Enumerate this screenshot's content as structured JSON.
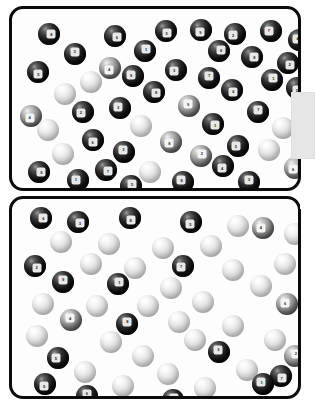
{
  "figure": {
    "panel_count": 2,
    "background_color": "#fefefe",
    "frame_color": "#0b0b0b",
    "frame_radius_px": 14
  },
  "side_tab": {
    "name": "right-edge-tab",
    "color": "#e6e6e6",
    "x": 291,
    "y": 92,
    "width": 24,
    "height": 67
  },
  "side_notch": {
    "name": "right-edge-notch",
    "color": "#ffffff",
    "x": 300,
    "y": 205,
    "width": 15,
    "height": 4
  },
  "chart_data": {
    "type": "scatter",
    "subtitle": "",
    "xlabel": "",
    "ylabel": "",
    "grid": false,
    "legend": "none",
    "xlim": [
      0,
      292
    ],
    "ylim": [
      0,
      203
    ],
    "categories": [
      "dark",
      "mid",
      "light"
    ],
    "series": [
      {
        "name": "panel-top",
        "panel": 1,
        "count": 48,
        "points": [
          {
            "x": 26,
            "y": 14,
            "r": 11,
            "tone": "dark",
            "label": "8"
          },
          {
            "x": 92,
            "y": 16,
            "r": 11,
            "tone": "dark",
            "label": "6"
          },
          {
            "x": 143,
            "y": 11,
            "r": 11,
            "tone": "dark",
            "label": "5"
          },
          {
            "x": 178,
            "y": 10,
            "r": 11,
            "tone": "dark",
            "label": "9"
          },
          {
            "x": 212,
            "y": 14,
            "r": 11,
            "tone": "dark",
            "label": "2"
          },
          {
            "x": 248,
            "y": 11,
            "r": 11,
            "tone": "dark",
            "label": "7"
          },
          {
            "x": 276,
            "y": 20,
            "r": 11,
            "tone": "dark",
            "label": "4"
          },
          {
            "x": 52,
            "y": 34,
            "r": 11,
            "tone": "dark",
            "label": "3"
          },
          {
            "x": 122,
            "y": 31,
            "r": 11,
            "tone": "dark",
            "label": "1"
          },
          {
            "x": 196,
            "y": 31,
            "r": 11,
            "tone": "dark",
            "label": "6"
          },
          {
            "x": 229,
            "y": 37,
            "r": 11,
            "tone": "dark",
            "label": "8"
          },
          {
            "x": 265,
            "y": 43,
            "r": 11,
            "tone": "dark",
            "label": "2"
          },
          {
            "x": 15,
            "y": 52,
            "r": 11,
            "tone": "dark",
            "label": "5"
          },
          {
            "x": 87,
            "y": 48,
            "r": 11,
            "tone": "mid",
            "label": "4"
          },
          {
            "x": 153,
            "y": 50,
            "r": 11,
            "tone": "dark",
            "label": "3"
          },
          {
            "x": 110,
            "y": 56,
            "r": 11,
            "tone": "dark",
            "label": "9"
          },
          {
            "x": 68,
            "y": 62,
            "r": 11,
            "tone": "light",
            "label": ""
          },
          {
            "x": 186,
            "y": 58,
            "r": 11,
            "tone": "dark",
            "label": "7"
          },
          {
            "x": 249,
            "y": 60,
            "r": 11,
            "tone": "dark",
            "label": "1"
          },
          {
            "x": 42,
            "y": 74,
            "r": 11,
            "tone": "light",
            "label": ""
          },
          {
            "x": 131,
            "y": 72,
            "r": 11,
            "tone": "dark",
            "label": "8"
          },
          {
            "x": 209,
            "y": 70,
            "r": 11,
            "tone": "dark",
            "label": "6"
          },
          {
            "x": 274,
            "y": 68,
            "r": 11,
            "tone": "dark",
            "label": "5"
          },
          {
            "x": 8,
            "y": 96,
            "r": 11,
            "tone": "mid",
            "label": "4"
          },
          {
            "x": 60,
            "y": 92,
            "r": 11,
            "tone": "dark",
            "label": "2"
          },
          {
            "x": 97,
            "y": 88,
            "r": 11,
            "tone": "dark",
            "label": "3"
          },
          {
            "x": 166,
            "y": 86,
            "r": 11,
            "tone": "mid",
            "label": "9"
          },
          {
            "x": 235,
            "y": 92,
            "r": 11,
            "tone": "dark",
            "label": "7"
          },
          {
            "x": 25,
            "y": 110,
            "r": 11,
            "tone": "light",
            "label": ""
          },
          {
            "x": 118,
            "y": 106,
            "r": 11,
            "tone": "light",
            "label": ""
          },
          {
            "x": 190,
            "y": 104,
            "r": 11,
            "tone": "dark",
            "label": "1"
          },
          {
            "x": 260,
            "y": 108,
            "r": 11,
            "tone": "light",
            "label": ""
          },
          {
            "x": 70,
            "y": 120,
            "r": 11,
            "tone": "dark",
            "label": "6"
          },
          {
            "x": 148,
            "y": 122,
            "r": 11,
            "tone": "mid",
            "label": "8"
          },
          {
            "x": 215,
            "y": 126,
            "r": 11,
            "tone": "dark",
            "label": "5"
          },
          {
            "x": 40,
            "y": 134,
            "r": 11,
            "tone": "light",
            "label": ""
          },
          {
            "x": 101,
            "y": 132,
            "r": 11,
            "tone": "dark",
            "label": "3"
          },
          {
            "x": 178,
            "y": 136,
            "r": 11,
            "tone": "mid",
            "label": "2"
          },
          {
            "x": 246,
            "y": 130,
            "r": 11,
            "tone": "light",
            "label": ""
          },
          {
            "x": 16,
            "y": 152,
            "r": 11,
            "tone": "dark",
            "label": "9"
          },
          {
            "x": 83,
            "y": 150,
            "r": 11,
            "tone": "dark",
            "label": "7"
          },
          {
            "x": 127,
            "y": 152,
            "r": 11,
            "tone": "light",
            "label": ""
          },
          {
            "x": 200,
            "y": 146,
            "r": 11,
            "tone": "dark",
            "label": "4"
          },
          {
            "x": 272,
            "y": 148,
            "r": 11,
            "tone": "mid",
            "label": "6"
          },
          {
            "x": 55,
            "y": 160,
            "r": 11,
            "tone": "dark",
            "label": "1"
          },
          {
            "x": 160,
            "y": 162,
            "r": 11,
            "tone": "dark",
            "label": "8"
          },
          {
            "x": 226,
            "y": 162,
            "r": 11,
            "tone": "dark",
            "label": "3"
          },
          {
            "x": 108,
            "y": 166,
            "r": 11,
            "tone": "dark",
            "label": "5"
          }
        ]
      },
      {
        "name": "panel-bottom",
        "panel": 2,
        "count": 48,
        "points": [
          {
            "x": 18,
            "y": 8,
            "r": 11,
            "tone": "dark",
            "label": "6"
          },
          {
            "x": 55,
            "y": 12,
            "r": 11,
            "tone": "dark",
            "label": "3"
          },
          {
            "x": 107,
            "y": 8,
            "r": 11,
            "tone": "dark",
            "label": "8"
          },
          {
            "x": 168,
            "y": 12,
            "r": 11,
            "tone": "dark",
            "label": "5"
          },
          {
            "x": 215,
            "y": 16,
            "r": 11,
            "tone": "light",
            "label": ""
          },
          {
            "x": 240,
            "y": 18,
            "r": 11,
            "tone": "mid",
            "label": "4"
          },
          {
            "x": 272,
            "y": 24,
            "r": 11,
            "tone": "light",
            "label": ""
          },
          {
            "x": 38,
            "y": 32,
            "r": 11,
            "tone": "light",
            "label": ""
          },
          {
            "x": 86,
            "y": 34,
            "r": 11,
            "tone": "light",
            "label": ""
          },
          {
            "x": 140,
            "y": 38,
            "r": 11,
            "tone": "light",
            "label": ""
          },
          {
            "x": 188,
            "y": 36,
            "r": 11,
            "tone": "light",
            "label": ""
          },
          {
            "x": 12,
            "y": 56,
            "r": 11,
            "tone": "dark",
            "label": "2"
          },
          {
            "x": 68,
            "y": 54,
            "r": 11,
            "tone": "light",
            "label": ""
          },
          {
            "x": 112,
            "y": 58,
            "r": 11,
            "tone": "light",
            "label": ""
          },
          {
            "x": 160,
            "y": 56,
            "r": 11,
            "tone": "dark",
            "label": "7"
          },
          {
            "x": 210,
            "y": 60,
            "r": 11,
            "tone": "light",
            "label": ""
          },
          {
            "x": 262,
            "y": 54,
            "r": 11,
            "tone": "light",
            "label": ""
          },
          {
            "x": 40,
            "y": 72,
            "r": 11,
            "tone": "dark",
            "label": "9"
          },
          {
            "x": 95,
            "y": 74,
            "r": 11,
            "tone": "dark",
            "label": "1"
          },
          {
            "x": 148,
            "y": 78,
            "r": 11,
            "tone": "light",
            "label": ""
          },
          {
            "x": 238,
            "y": 76,
            "r": 11,
            "tone": "light",
            "label": ""
          },
          {
            "x": 20,
            "y": 94,
            "r": 11,
            "tone": "light",
            "label": ""
          },
          {
            "x": 74,
            "y": 96,
            "r": 11,
            "tone": "light",
            "label": ""
          },
          {
            "x": 125,
            "y": 96,
            "r": 11,
            "tone": "light",
            "label": ""
          },
          {
            "x": 180,
            "y": 92,
            "r": 11,
            "tone": "light",
            "label": ""
          },
          {
            "x": 264,
            "y": 94,
            "r": 11,
            "tone": "mid",
            "label": "6"
          },
          {
            "x": 48,
            "y": 110,
            "r": 11,
            "tone": "mid",
            "label": "4"
          },
          {
            "x": 104,
            "y": 114,
            "r": 11,
            "tone": "dark",
            "label": "8"
          },
          {
            "x": 156,
            "y": 112,
            "r": 11,
            "tone": "light",
            "label": ""
          },
          {
            "x": 210,
            "y": 116,
            "r": 11,
            "tone": "light",
            "label": ""
          },
          {
            "x": 14,
            "y": 126,
            "r": 11,
            "tone": "light",
            "label": ""
          },
          {
            "x": 88,
            "y": 132,
            "r": 11,
            "tone": "light",
            "label": ""
          },
          {
            "x": 172,
            "y": 130,
            "r": 11,
            "tone": "light",
            "label": ""
          },
          {
            "x": 252,
            "y": 130,
            "r": 11,
            "tone": "light",
            "label": ""
          },
          {
            "x": 35,
            "y": 148,
            "r": 11,
            "tone": "dark",
            "label": "5"
          },
          {
            "x": 120,
            "y": 146,
            "r": 11,
            "tone": "light",
            "label": ""
          },
          {
            "x": 196,
            "y": 142,
            "r": 11,
            "tone": "dark",
            "label": "3"
          },
          {
            "x": 272,
            "y": 146,
            "r": 11,
            "tone": "mid",
            "label": "2"
          },
          {
            "x": 62,
            "y": 162,
            "r": 11,
            "tone": "light",
            "label": ""
          },
          {
            "x": 145,
            "y": 164,
            "r": 11,
            "tone": "light",
            "label": ""
          },
          {
            "x": 224,
            "y": 160,
            "r": 11,
            "tone": "light",
            "label": ""
          },
          {
            "x": 258,
            "y": 166,
            "r": 11,
            "tone": "dark",
            "label": "7"
          },
          {
            "x": 22,
            "y": 174,
            "r": 11,
            "tone": "dark",
            "label": "9"
          },
          {
            "x": 100,
            "y": 176,
            "r": 11,
            "tone": "light",
            "label": ""
          },
          {
            "x": 182,
            "y": 178,
            "r": 11,
            "tone": "light",
            "label": ""
          },
          {
            "x": 240,
            "y": 174,
            "r": 11,
            "tone": "dark",
            "label": "1"
          },
          {
            "x": 64,
            "y": 186,
            "r": 11,
            "tone": "dark",
            "label": "6"
          },
          {
            "x": 150,
            "y": 190,
            "r": 11,
            "tone": "dark",
            "label": "4"
          }
        ]
      }
    ]
  }
}
